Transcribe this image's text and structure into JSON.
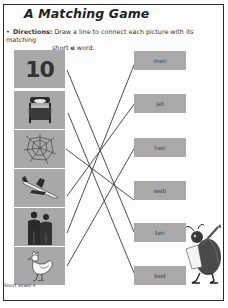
{
  "worksheet": {
    "title": "A Matching Game",
    "directions": {
      "label": "Directions:",
      "text_line1": "Draw a line to connect each picture with its matching",
      "text_line2_pre": "short ",
      "text_line2_vowel": "e",
      "text_line2_post": " word."
    },
    "pictures": [
      {
        "name": "number-ten",
        "label": "10"
      },
      {
        "name": "bed",
        "label": ""
      },
      {
        "name": "spider-web",
        "label": ""
      },
      {
        "name": "jet",
        "label": ""
      },
      {
        "name": "men",
        "label": ""
      },
      {
        "name": "hen",
        "label": ""
      }
    ],
    "words": [
      "men",
      "jet",
      "hen",
      "web",
      "ten",
      "bed"
    ],
    "connections": [
      {
        "picture": "number-ten",
        "word": "ten"
      },
      {
        "picture": "bed",
        "word": "bed"
      },
      {
        "picture": "spider-web",
        "word": "web"
      },
      {
        "picture": "jet",
        "word": "jet"
      },
      {
        "picture": "men",
        "word": "men"
      },
      {
        "picture": "hen",
        "word": "hen"
      }
    ],
    "footer": "Short Vowel e"
  },
  "colors": {
    "box_fill": "#a8a8a8",
    "line": "#3a3a3a",
    "border": "#2a2a2a"
  }
}
